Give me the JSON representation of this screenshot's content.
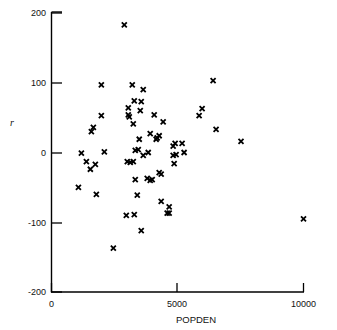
{
  "chart_data": {
    "type": "scatter",
    "title": "",
    "xlabel": "POPDEN",
    "ylabel": "r",
    "xlim": [
      0,
      10000
    ],
    "ylim": [
      -200,
      200
    ],
    "xticks": [
      0,
      5000,
      10000
    ],
    "xticklabels": [
      "0",
      "5000",
      "10000"
    ],
    "yticks": [
      200,
      100,
      0,
      -100,
      -200
    ],
    "yticklabels": [
      "200",
      "100",
      "0",
      "-100",
      "-200"
    ],
    "grid": false,
    "legend": null,
    "marker": "x",
    "marker_color": "#000000",
    "series": [
      {
        "name": "observations",
        "points": [
          [
            2889,
            183
          ],
          [
            1978,
            97
          ],
          [
            3205,
            97
          ],
          [
            3640,
            90
          ],
          [
            6413,
            103
          ],
          [
            3284,
            74
          ],
          [
            3561,
            73
          ],
          [
            3047,
            64
          ],
          [
            3522,
            60
          ],
          [
            5977,
            63
          ],
          [
            5858,
            53
          ],
          [
            1978,
            53
          ],
          [
            3047,
            54
          ],
          [
            3086,
            51
          ],
          [
            4075,
            54
          ],
          [
            4431,
            44
          ],
          [
            3245,
            41
          ],
          [
            1661,
            36
          ],
          [
            1582,
            30
          ],
          [
            6531,
            33
          ],
          [
            3482,
            19
          ],
          [
            3917,
            27
          ],
          [
            4273,
            24
          ],
          [
            7520,
            16
          ],
          [
            4154,
            19
          ],
          [
            4194,
            21
          ],
          [
            4906,
            13
          ],
          [
            5183,
            13
          ],
          [
            4827,
            9
          ],
          [
            2097,
            1
          ],
          [
            3324,
            3
          ],
          [
            3443,
            4
          ],
          [
            3838,
            0
          ],
          [
            5262,
            0
          ],
          [
            4827,
            -4
          ],
          [
            4945,
            -3
          ],
          [
            3640,
            -4
          ],
          [
            1186,
            -1
          ],
          [
            1384,
            -13
          ],
          [
            1740,
            -17
          ],
          [
            1542,
            -24
          ],
          [
            3007,
            -13
          ],
          [
            3126,
            -14
          ],
          [
            3245,
            -13
          ],
          [
            4867,
            -16
          ],
          [
            4273,
            -29
          ],
          [
            4352,
            -31
          ],
          [
            3324,
            -39
          ],
          [
            3798,
            -37
          ],
          [
            3917,
            -40
          ],
          [
            3996,
            -39
          ],
          [
            1068,
            -50
          ],
          [
            1780,
            -60
          ],
          [
            3403,
            -61
          ],
          [
            4352,
            -70
          ],
          [
            4669,
            -78
          ],
          [
            2968,
            -90
          ],
          [
            3284,
            -89
          ],
          [
            4590,
            -87
          ],
          [
            4669,
            -87
          ],
          [
            3561,
            -112
          ],
          [
            2454,
            -137
          ],
          [
            10000,
            -95
          ]
        ]
      }
    ]
  },
  "axes": {
    "x_axis_name": "popden-axis",
    "y_axis_name": "r-axis"
  }
}
